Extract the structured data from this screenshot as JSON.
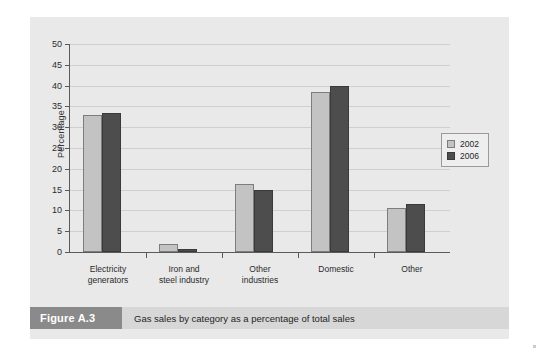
{
  "figure": {
    "number_label": "Figure A.3",
    "caption": "Gas sales by category as a percentage of total sales"
  },
  "colors": {
    "panel_background": "#e9e9e9",
    "series_2002": "#c3c3c3",
    "series_2006": "#4d4d4d",
    "axis": "#5a5a5a",
    "gridline": "#cfcfcf",
    "figure_number_bar": "#8a8a8a",
    "caption_bar": "#d7d7d7"
  },
  "chart_data": {
    "type": "bar",
    "title": "",
    "subtitle": "",
    "xlabel": "",
    "ylabel": "Percentage",
    "ylim": [
      0,
      50
    ],
    "ytick_step": 5,
    "yticks": [
      0,
      5,
      10,
      15,
      20,
      25,
      30,
      35,
      40,
      45,
      50
    ],
    "ytick_labels": [
      "0",
      "5",
      "10",
      "15",
      "20",
      "25",
      "30",
      "35",
      "40",
      "45",
      "50"
    ],
    "grid": true,
    "grid_axis": "y",
    "legend_position": "right",
    "categories": [
      "Electricity generators",
      "Iron and steel industry",
      "Other industries",
      "Domestic",
      "Other"
    ],
    "category_label_lines": [
      [
        "Electricity",
        "generators"
      ],
      [
        "Iron and",
        "steel industry"
      ],
      [
        "Other",
        "industries"
      ],
      [
        "Domestic",
        ""
      ],
      [
        "Other",
        ""
      ]
    ],
    "series": [
      {
        "name": "2002",
        "color": "#c3c3c3",
        "values": [
          33.0,
          2.0,
          16.4,
          38.5,
          10.5
        ]
      },
      {
        "name": "2006",
        "color": "#4d4d4d",
        "values": [
          33.5,
          0.7,
          14.8,
          39.9,
          11.6
        ]
      }
    ]
  }
}
